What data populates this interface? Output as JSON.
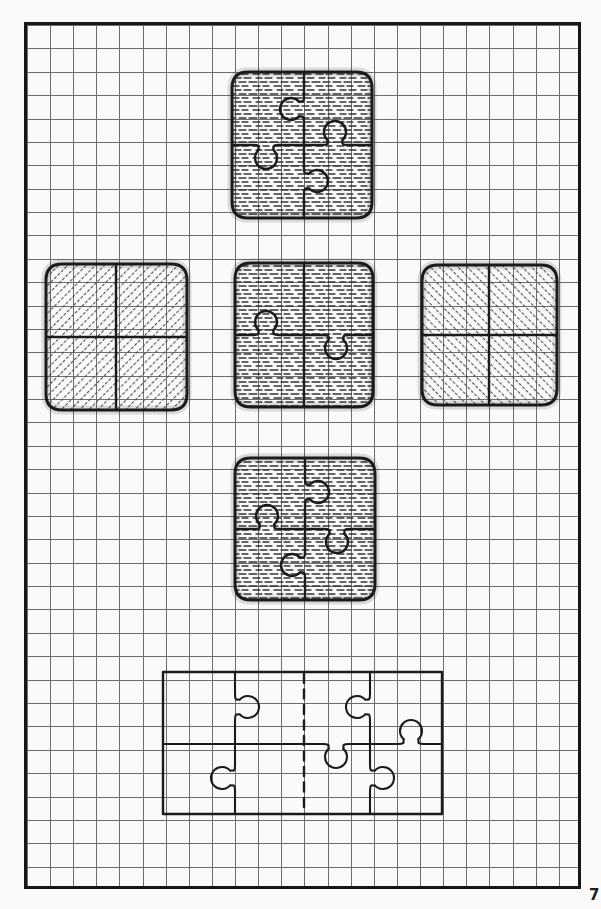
{
  "page": {
    "width": 601,
    "height": 909,
    "background": "#fbfaf8",
    "margin_mark": "7"
  },
  "frame": {
    "x": 24,
    "y": 22,
    "w": 557,
    "h": 867,
    "border_color": "#161616",
    "border_width": 3,
    "grid": {
      "cell_w": 23.125,
      "cell_h": 23.38,
      "color": "#6d6d6d",
      "line_width": 1
    }
  },
  "ink_color": "#1b1b1b",
  "textures": {
    "hdash_color": "#333333",
    "diag_color": "#4e4e4e",
    "edge_shade": "rgba(40,40,40,0.15)"
  },
  "figures": [
    {
      "name": "top-puzzle-square",
      "texture": "tex-hdash",
      "outline": {
        "x": 232,
        "y": 72,
        "w": 140,
        "h": 146,
        "rx": 16,
        "sw": 3
      },
      "lines": [
        {
          "type": "v",
          "at": 304,
          "from": 72,
          "to": 145,
          "tabs": [
            {
              "at": 109,
              "dir": "left"
            }
          ]
        },
        {
          "type": "v",
          "at": 304,
          "from": 145,
          "to": 218,
          "tabs": [
            {
              "at": 181,
              "dir": "right"
            }
          ]
        },
        {
          "type": "h",
          "at": 145,
          "from": 232,
          "to": 304,
          "tabs": [
            {
              "at": 266,
              "dir": "down"
            }
          ]
        },
        {
          "type": "h",
          "at": 145,
          "from": 304,
          "to": 372,
          "tabs": [
            {
              "at": 335,
              "dir": "up"
            }
          ]
        }
      ]
    },
    {
      "name": "left-hatched-square",
      "texture": "tex-diag-up",
      "outline": {
        "x": 46,
        "y": 264,
        "w": 141,
        "h": 146,
        "rx": 16,
        "sw": 3
      },
      "lines": [
        {
          "type": "v",
          "at": 116,
          "from": 264,
          "to": 410
        },
        {
          "type": "h",
          "at": 337,
          "from": 46,
          "to": 187
        }
      ]
    },
    {
      "name": "center-puzzle-square",
      "texture": "tex-hdash",
      "outline": {
        "x": 235,
        "y": 263,
        "w": 138,
        "h": 144,
        "rx": 16,
        "sw": 3
      },
      "lines": [
        {
          "type": "v",
          "at": 304,
          "from": 263,
          "to": 407
        },
        {
          "type": "h",
          "at": 335,
          "from": 235,
          "to": 304,
          "tabs": [
            {
              "at": 266,
              "dir": "up"
            }
          ]
        },
        {
          "type": "h",
          "at": 335,
          "from": 304,
          "to": 373,
          "tabs": [
            {
              "at": 336,
              "dir": "down"
            }
          ]
        }
      ]
    },
    {
      "name": "right-hatched-square",
      "texture": "tex-diag-down",
      "outline": {
        "x": 422,
        "y": 265,
        "w": 135,
        "h": 140,
        "rx": 16,
        "sw": 3
      },
      "lines": [
        {
          "type": "v",
          "at": 489,
          "from": 265,
          "to": 405
        },
        {
          "type": "h",
          "at": 335,
          "from": 422,
          "to": 557
        }
      ]
    },
    {
      "name": "bottom-puzzle-square",
      "texture": "tex-hdash",
      "outline": {
        "x": 235,
        "y": 458,
        "w": 140,
        "h": 142,
        "rx": 16,
        "sw": 3
      },
      "lines": [
        {
          "type": "v",
          "at": 305,
          "from": 458,
          "to": 529,
          "tabs": [
            {
              "at": 492,
              "dir": "right"
            }
          ]
        },
        {
          "type": "v",
          "at": 305,
          "from": 529,
          "to": 600,
          "tabs": [
            {
              "at": 565,
              "dir": "left"
            }
          ]
        },
        {
          "type": "h",
          "at": 529,
          "from": 235,
          "to": 305,
          "tabs": [
            {
              "at": 267,
              "dir": "up"
            }
          ]
        },
        {
          "type": "h",
          "at": 529,
          "from": 305,
          "to": 375,
          "tabs": [
            {
              "at": 337,
              "dir": "down"
            }
          ]
        }
      ]
    },
    {
      "name": "flat-puzzle-template",
      "texture": null,
      "outline": {
        "x": 163,
        "y": 672,
        "w": 279,
        "h": 142,
        "rx": 0,
        "sw": 2.4
      },
      "lines": [
        {
          "type": "v",
          "at": 235,
          "from": 672,
          "to": 744,
          "sw": 2.1,
          "tabs": [
            {
              "at": 707,
              "dir": "right"
            }
          ]
        },
        {
          "type": "v",
          "at": 235,
          "from": 744,
          "to": 814,
          "sw": 2.1,
          "tabs": [
            {
              "at": 778,
              "dir": "left"
            }
          ]
        },
        {
          "type": "v",
          "at": 304,
          "from": 674,
          "to": 812,
          "sw": 2.4,
          "dash": "9 6.5"
        },
        {
          "type": "v",
          "at": 370,
          "from": 672,
          "to": 744,
          "sw": 2.1,
          "tabs": [
            {
              "at": 707,
              "dir": "left"
            }
          ]
        },
        {
          "type": "v",
          "at": 370,
          "from": 744,
          "to": 814,
          "sw": 2.1,
          "tabs": [
            {
              "at": 778,
              "dir": "right"
            }
          ]
        },
        {
          "type": "h",
          "at": 744,
          "from": 163,
          "to": 442,
          "sw": 2.1,
          "tabs": [
            {
              "at": 336,
              "dir": "down"
            },
            {
              "at": 411,
              "dir": "up"
            }
          ]
        }
      ]
    }
  ]
}
